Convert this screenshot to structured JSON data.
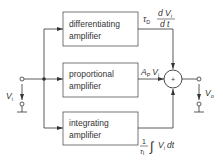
{
  "diagram": {
    "blocks": [
      {
        "id": "differentiating",
        "line1": "differentiating",
        "line2": "amplifier"
      },
      {
        "id": "proportional",
        "line1": "proportional",
        "line2": "amplifier"
      },
      {
        "id": "integrating",
        "line1": "integrating",
        "line2": "amplifier"
      }
    ],
    "input": {
      "symbol": "V",
      "subscript": "i"
    },
    "output": {
      "symbol": "V",
      "subscript": "o"
    },
    "summing_junction": {
      "symbol": "+"
    },
    "expressions": {
      "differential": {
        "coef": "τ",
        "coef_sub": "D",
        "num": "d V",
        "num_sub": "i",
        "den": "d t"
      },
      "proportional": {
        "coef": "A",
        "coef_sub": "P",
        "var": "V",
        "var_sub": "i"
      },
      "integral": {
        "num": "1",
        "den": "τ",
        "den_sub": "I",
        "integral_sign": "∫",
        "var": "V",
        "var_sub": "i",
        "dt": "dt"
      }
    },
    "colors": {
      "line": "#333333",
      "box_border": "#555555",
      "background": "#ffffff"
    }
  }
}
